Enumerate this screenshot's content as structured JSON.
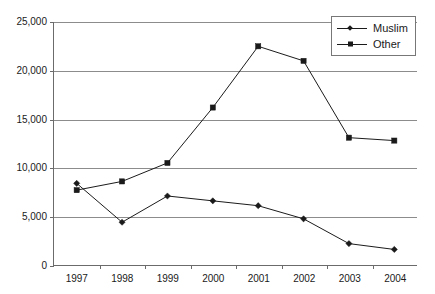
{
  "chart_data": {
    "type": "line",
    "title": "",
    "xlabel": "",
    "ylabel": "",
    "categories": [
      "1997",
      "1998",
      "1999",
      "2000",
      "2001",
      "2002",
      "2003",
      "2004"
    ],
    "series": [
      {
        "name": "Muslim",
        "marker": "diamond",
        "color": "#1a1a1a",
        "values": [
          8400,
          4400,
          7100,
          6600,
          6100,
          4750,
          2200,
          1600
        ]
      },
      {
        "name": "Other",
        "marker": "square",
        "color": "#1a1a1a",
        "values": [
          7700,
          8600,
          10500,
          16200,
          22500,
          21000,
          13100,
          12800
        ]
      }
    ],
    "ylim": [
      0,
      25000
    ],
    "yticks": [
      0,
      5000,
      10000,
      15000,
      20000,
      25000
    ],
    "ytick_labels": [
      "0",
      "5,000",
      "10,000",
      "15,000",
      "20,000",
      "25,000"
    ],
    "grid": true,
    "grid_axis": "y",
    "legend_position": "top-right",
    "legend_entries": [
      "Muslim",
      "Other"
    ],
    "line_color": "#1a1a1a",
    "grid_color": "#8c8c8c",
    "axis_color": "#6b6b6b",
    "background": "#ffffff"
  }
}
